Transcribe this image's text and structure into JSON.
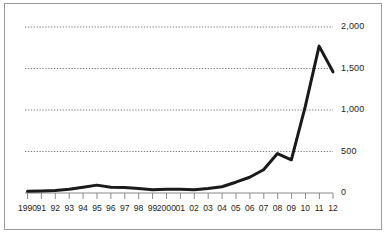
{
  "chart_data": {
    "type": "line",
    "title": "",
    "subtitle": "",
    "xlabel": "",
    "ylabel": "",
    "x": [
      "1990",
      "91",
      "92",
      "93",
      "94",
      "95",
      "96",
      "97",
      "98",
      "99",
      "2000",
      "01",
      "02",
      "03",
      "04",
      "05",
      "06",
      "07",
      "08",
      "09",
      "10",
      "11",
      "12"
    ],
    "values": [
      20,
      25,
      30,
      45,
      70,
      95,
      70,
      65,
      55,
      40,
      45,
      45,
      40,
      55,
      75,
      130,
      190,
      280,
      475,
      400,
      1040,
      1770,
      1460
    ],
    "series": [
      {
        "name": "series-1",
        "values": [
          20,
          25,
          30,
          45,
          70,
          95,
          70,
          65,
          55,
          40,
          45,
          45,
          40,
          55,
          75,
          130,
          190,
          280,
          475,
          400,
          1040,
          1770,
          1460
        ]
      }
    ],
    "ylim": [
      0,
      2000
    ],
    "yticks": [
      0,
      500,
      1000,
      1500,
      2000
    ],
    "ytick_labels": [
      "0",
      "500",
      "1,000",
      "1,500",
      "2,000"
    ],
    "xtick_labels": [
      "1990",
      "91",
      "92",
      "93",
      "94",
      "95",
      "96",
      "97",
      "98",
      "99",
      "2000",
      "01",
      "02",
      "03",
      "04",
      "05",
      "06",
      "07",
      "08",
      "09",
      "10",
      "11",
      "12"
    ],
    "grid": true,
    "grid_axis": "y",
    "grid_style": "dotted",
    "legend": false,
    "legend_position": "none",
    "line_color": "#1a1a1a",
    "line_width": 3,
    "grid_color": "#6d6d6d",
    "axis_color": "#8a8a8a",
    "border_color": "#9b9b9b",
    "background_color": "#ffffff",
    "text_color": "#231f20",
    "ytick_label_side": "right"
  }
}
